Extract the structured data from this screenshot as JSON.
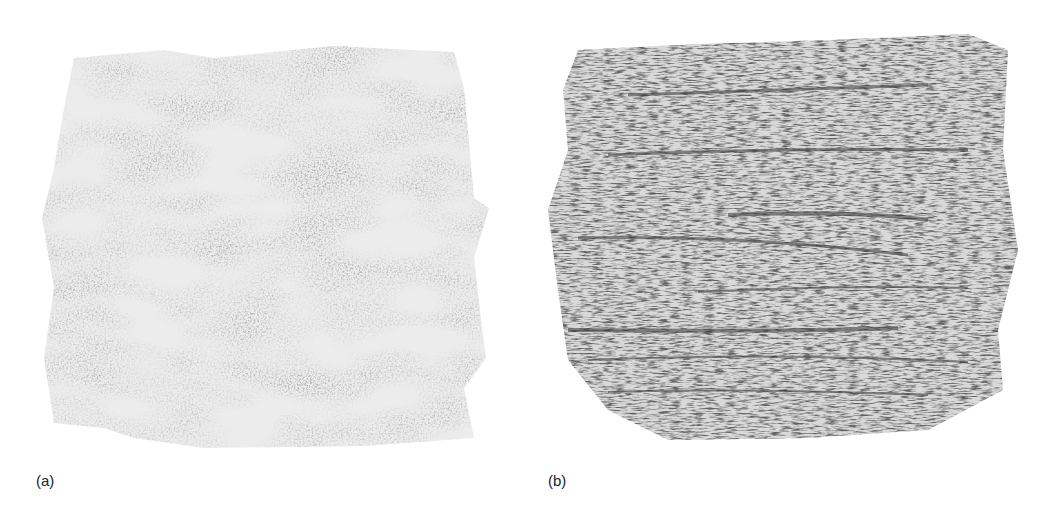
{
  "figure": {
    "panels": [
      {
        "id": "a",
        "label": "(a)",
        "description": "light diffuse grayscale pencil-rubbing texture"
      },
      {
        "id": "b",
        "label": "(b)",
        "description": "darker streaky grayscale texture with horizontal strokes"
      }
    ]
  }
}
